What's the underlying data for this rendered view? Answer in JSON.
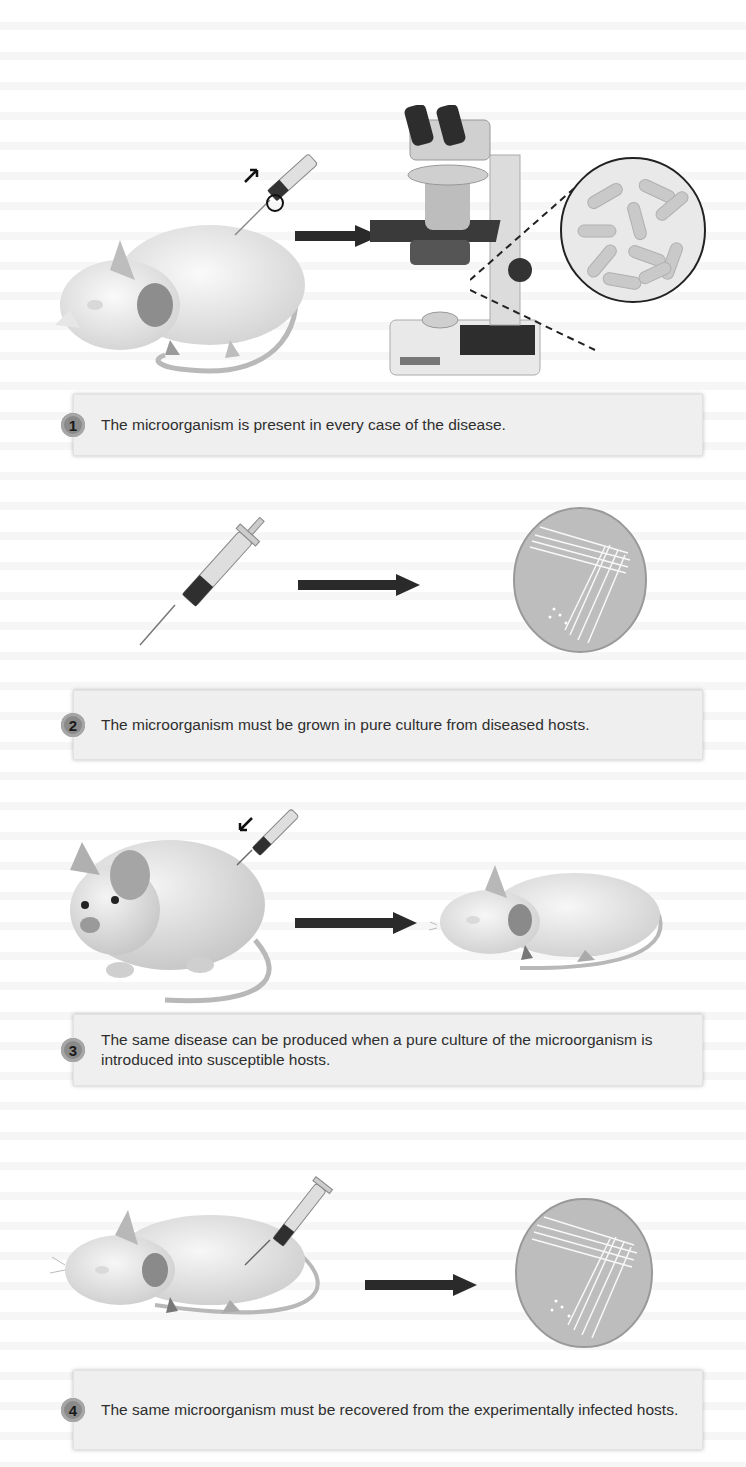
{
  "figure": {
    "steps": [
      {
        "number": "1",
        "text": "The microorganism is present in every case of the disease.",
        "illustration": [
          "diseased-mouse",
          "syringe-sampling",
          "arrow",
          "microscope",
          "magnified-bacilli"
        ]
      },
      {
        "number": "2",
        "text": "The microorganism must be grown in pure culture from diseased hosts.",
        "illustration": [
          "syringe",
          "arrow",
          "petri-dish-streak-culture"
        ]
      },
      {
        "number": "3",
        "text": "The same disease can be produced when a pure culture of the microorganism is introduced into susceptible hosts.",
        "illustration": [
          "healthy-mouse-injected",
          "arrow",
          "diseased-mouse"
        ]
      },
      {
        "number": "4",
        "text": "The same microorganism must be recovered from the experimentally infected hosts.",
        "illustration": [
          "diseased-mouse-sampled",
          "arrow",
          "petri-dish-streak-culture"
        ]
      }
    ]
  },
  "colors": {
    "caption_bg": "#efefef",
    "badge": "#8a8a8a",
    "text": "#2e2e2e",
    "arrow": "#2a2a2a"
  }
}
